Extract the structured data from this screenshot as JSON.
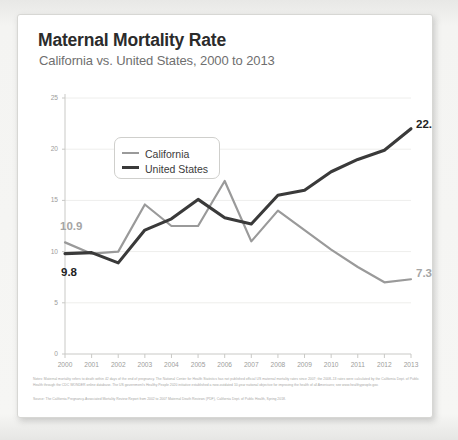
{
  "card": {
    "title": "Maternal Mortality Rate",
    "subtitle": "California vs. United States, 2000 to 2013"
  },
  "footer": {
    "notes": "Notes: Maternal mortality refers to death within 42 days of the end of pregnancy. The National Center for Health Statistics has not published official US maternal mortality rates since 2007; the 2008–13 rates were calculated by the California Dept. of Public Health through the CDC WONDER online database. The US government's Healthy People 2020 initiative established a now-outdated 10-year national objective for improving the health of all Americans; see www.healthypeople.gov.",
    "source": "Source: The California Pregnancy-Associated Mortality Review Report from 2002 to 2007 Maternal Death Reviews (PDF), California Dept. of Public Health, Spring 2018."
  },
  "legend": {
    "position": "inside-top-left",
    "items": [
      {
        "label": "California",
        "color": "#9a9a9a",
        "key": "swatch-california"
      },
      {
        "label": "United States",
        "color": "#3a3a3a",
        "key": "swatch-united-states"
      }
    ]
  },
  "labels": {
    "ca_start": "10.9",
    "us_start": "9.8",
    "us_end": "22.0",
    "ca_end": "7.3"
  },
  "chart_data": {
    "type": "line",
    "title": "Maternal Mortality Rate",
    "subtitle": "California vs. United States, 2000 to 2013",
    "xlabel": "",
    "ylabel": "",
    "grid": true,
    "legend_position": "inside-top-left",
    "x": [
      2000,
      2001,
      2002,
      2003,
      2004,
      2005,
      2006,
      2007,
      2008,
      2009,
      2010,
      2011,
      2012,
      2013
    ],
    "xticklabels": [
      "2000",
      "2001",
      "2002",
      "2003",
      "2004",
      "2005",
      "2006",
      "2007",
      "2008",
      "2009",
      "2010",
      "2011",
      "2012",
      "2013"
    ],
    "xlim": [
      2000,
      2013
    ],
    "ylim": [
      0,
      25
    ],
    "yticks": [
      0,
      5,
      10,
      15,
      20,
      25
    ],
    "yticklabels": [
      "0",
      "5",
      "10",
      "15",
      "20",
      "25"
    ],
    "series": [
      {
        "name": "California",
        "color": "#9a9a9a",
        "values": [
          10.9,
          9.8,
          10.0,
          14.6,
          12.5,
          12.5,
          16.9,
          11.0,
          14.0,
          12.1,
          10.2,
          8.5,
          7.0,
          7.3
        ],
        "point_labels": {
          "2000": "10.9",
          "2013": "7.3"
        }
      },
      {
        "name": "United States",
        "color": "#3a3a3a",
        "values": [
          9.8,
          9.9,
          8.9,
          12.1,
          13.2,
          15.1,
          13.3,
          12.7,
          15.5,
          16.0,
          17.8,
          19.0,
          19.9,
          22.0
        ],
        "point_labels": {
          "2000": "9.8",
          "2013": "22.0"
        }
      }
    ]
  }
}
